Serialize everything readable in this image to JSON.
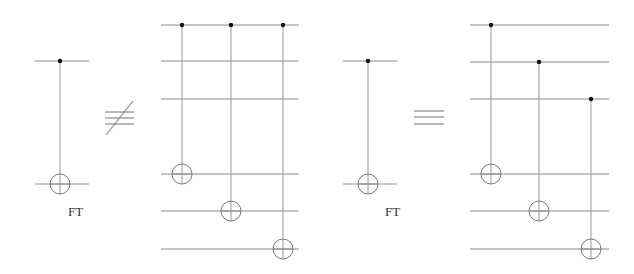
{
  "diagram": {
    "type": "quantum-circuit-identity",
    "colors": {
      "wire": "#8a8a8a",
      "control": "#111111",
      "target": "#7a7a7a",
      "background": "#ffffff"
    },
    "circuits": [
      {
        "id": "ft-gate-left",
        "label": "FT",
        "wires_y": [
          61,
          184
        ],
        "x_range": [
          35,
          89
        ],
        "gates": [
          {
            "type": "cnot",
            "x": 60,
            "control_y": 61,
            "target_y": 184
          }
        ]
      },
      {
        "id": "transversal-expansion-1",
        "label": "",
        "wires_y": [
          25,
          61,
          99,
          174,
          211,
          249
        ],
        "x_range": [
          161,
          299
        ],
        "gates": [
          {
            "type": "cnot",
            "x": 182,
            "control_y": 25,
            "target_y": 174
          },
          {
            "type": "cnot",
            "x": 231,
            "control_y": 25,
            "target_y": 211
          },
          {
            "type": "cnot",
            "x": 283,
            "control_y": 25,
            "target_y": 249
          }
        ]
      },
      {
        "id": "ft-gate-right",
        "label": "FT",
        "wires_y": [
          61,
          184
        ],
        "x_range": [
          343,
          397
        ],
        "gates": [
          {
            "type": "cnot",
            "x": 368,
            "control_y": 61,
            "target_y": 184
          }
        ]
      },
      {
        "id": "transversal-expansion-2",
        "label": "",
        "wires_y": [
          25,
          62,
          99,
          174,
          211,
          249
        ],
        "x_range": [
          470,
          609
        ],
        "gates": [
          {
            "type": "cnot",
            "x": 491,
            "control_y": 25,
            "target_y": 174
          },
          {
            "type": "cnot",
            "x": 539,
            "control_y": 62,
            "target_y": 211
          },
          {
            "type": "cnot",
            "x": 591,
            "control_y": 99,
            "target_y": 249
          }
        ]
      }
    ],
    "relations": [
      {
        "symbol": "not-equivalent",
        "glyph": "≢",
        "between": [
          "ft-gate-left",
          "transversal-expansion-1"
        ]
      },
      {
        "symbol": "equivalent",
        "glyph": "≡",
        "between": [
          "ft-gate-right",
          "transversal-expansion-2"
        ]
      }
    ],
    "labels": {
      "ft_left": "FT",
      "ft_right": "FT"
    }
  }
}
